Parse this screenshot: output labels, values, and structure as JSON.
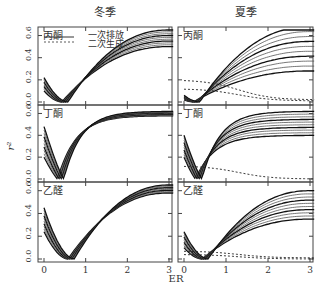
{
  "chart_data": {
    "type": "line",
    "layout": "3x2 panels",
    "column_titles": [
      "冬季",
      "夏季"
    ],
    "row_labels": [
      "丙酮",
      "丁酮",
      "乙醛"
    ],
    "xlabel": "ER",
    "ylabel": "r²",
    "xlim": [
      0,
      3.2
    ],
    "ylim": [
      0,
      0.65
    ],
    "xticks": [
      "0",
      "1",
      "2",
      "3"
    ],
    "yticks": [
      "0.0",
      "0.2",
      "0.4",
      "0.6"
    ],
    "legend": [
      {
        "label": "一次排放",
        "style": "solid"
      },
      {
        "label": "二次生成",
        "style": "dashed"
      }
    ],
    "panels": [
      {
        "season": "冬季",
        "compound": "丙酮",
        "min_er": 0.5,
        "solid_at_er0": [
          0.1,
          0.22
        ],
        "solid_at_er3": [
          0.5,
          0.65
        ],
        "dashed": []
      },
      {
        "season": "夏季",
        "compound": "丙酮",
        "min_er": 0.3,
        "solid_at_er0": [
          0.02,
          0.06
        ],
        "solid_at_er3": [
          0.28,
          0.68
        ],
        "dashed": [
          {
            "start": 0.2,
            "end": 0.02
          },
          {
            "start": 0.12,
            "end": 0.01
          }
        ]
      },
      {
        "season": "冬季",
        "compound": "丁酮",
        "min_er": 0.4,
        "solid_at_er0": [
          0.2,
          0.48
        ],
        "solid_at_er3": [
          0.58,
          0.62
        ],
        "dashed": []
      },
      {
        "season": "夏季",
        "compound": "丁酮",
        "min_er": 0.35,
        "solid_at_er0": [
          0.2,
          0.4
        ],
        "solid_at_er3": [
          0.4,
          0.62
        ],
        "dashed": [
          {
            "start": 0.12,
            "end": 0.0
          }
        ]
      },
      {
        "season": "冬季",
        "compound": "乙醛",
        "min_er": 0.65,
        "solid_at_er0": [
          0.24,
          0.45
        ],
        "solid_at_er3": [
          0.58,
          0.65
        ],
        "dashed": []
      },
      {
        "season": "夏季",
        "compound": "乙醛",
        "min_er": 0.5,
        "solid_at_er0": [
          0.1,
          0.24
        ],
        "solid_at_er3": [
          0.35,
          0.6
        ],
        "dashed": [
          {
            "start": 0.07,
            "end": 0.01
          },
          {
            "start": 0.04,
            "end": 0.0
          }
        ]
      }
    ]
  }
}
